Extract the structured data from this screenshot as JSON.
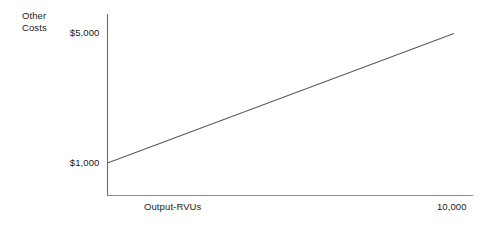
{
  "chart_data": {
    "type": "line",
    "title": "",
    "subtitle": "",
    "ylabel": "Other Costs",
    "ylabel_lines": [
      "Other",
      "Costs"
    ],
    "xlabel": "Output-RVUs",
    "x": [
      0,
      10000
    ],
    "values": [
      1000,
      5000
    ],
    "series": [
      {
        "name": "Other Costs",
        "x": [
          0,
          10000
        ],
        "values": [
          1000,
          5000
        ]
      }
    ],
    "ytick_labels": [
      "$5,000",
      "$1,000"
    ],
    "ytick_values": [
      5000,
      1000
    ],
    "xtick_labels": [
      "10,000"
    ],
    "xtick_values": [
      10000
    ],
    "ylim": [
      0,
      5600
    ],
    "xlim": [
      0,
      10550
    ],
    "grid": false,
    "legend": false,
    "legend_position": "none",
    "annotations": [],
    "line_color": "#5a5a5a",
    "axis_color": "#6e6e6e",
    "xaxis_color": "#8a8a8a",
    "text_color": "#1a1a1a",
    "background_color": "#ffffff"
  },
  "axes": {
    "y_axis_name": "y-axis",
    "x_axis_name": "x-axis"
  }
}
